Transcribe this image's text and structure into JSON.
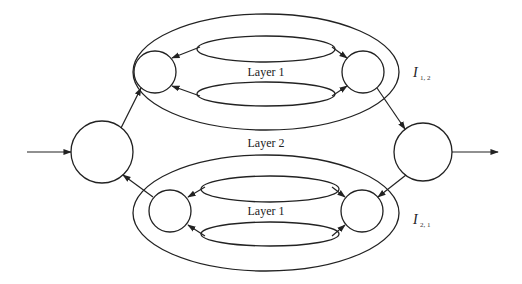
{
  "diagram": {
    "type": "layered-network",
    "labels": {
      "layer1_top": "Layer 1",
      "layer1_bottom": "Layer 1",
      "layer2": "Layer 2",
      "interface_top_main": "I",
      "interface_top_sub": "1, 2",
      "interface_bottom_main": "I",
      "interface_bottom_sub": "2, 1"
    },
    "nodes": [
      {
        "id": "input-node",
        "shape": "circle"
      },
      {
        "id": "output-node",
        "shape": "circle"
      },
      {
        "id": "top-left-node",
        "group": "I_1,2",
        "shape": "circle"
      },
      {
        "id": "top-right-node",
        "group": "I_1,2",
        "shape": "circle"
      },
      {
        "id": "bottom-left-node",
        "group": "I_2,1",
        "shape": "circle"
      },
      {
        "id": "bottom-right-node",
        "group": "I_2,1",
        "shape": "circle"
      }
    ],
    "edges": [
      {
        "from": "external",
        "to": "input-node"
      },
      {
        "from": "input-node",
        "to": "top-left-node"
      },
      {
        "from": "top-left-node",
        "to": "top-right-node",
        "via": "upper loop"
      },
      {
        "from": "top-right-node",
        "to": "top-left-node",
        "via": "lower loop"
      },
      {
        "from": "top-right-node",
        "to": "output-node"
      },
      {
        "from": "output-node",
        "to": "bottom-right-node"
      },
      {
        "from": "bottom-left-node",
        "to": "bottom-right-node",
        "via": "upper loop"
      },
      {
        "from": "bottom-right-node",
        "to": "bottom-left-node",
        "via": "lower loop"
      },
      {
        "from": "bottom-left-node",
        "to": "input-node"
      },
      {
        "from": "output-node",
        "to": "external"
      }
    ],
    "colors": {
      "stroke": "#222222",
      "background": "#ffffff"
    }
  }
}
